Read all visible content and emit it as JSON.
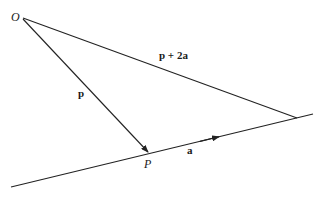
{
  "diagram": {
    "type": "vector-geometry",
    "points": {
      "O": {
        "label": "O",
        "x": 21,
        "y": 17
      },
      "P": {
        "label": "P",
        "x": 149,
        "y": 153
      },
      "Q": {
        "x": 297,
        "y": 118
      }
    },
    "line": {
      "x1": 11,
      "y1": 187,
      "x2": 313,
      "y2": 114
    },
    "vectors": [
      {
        "from": "O",
        "to": "P",
        "label": "p"
      },
      {
        "from": "O",
        "to": "Q",
        "label": "p + 2a"
      },
      {
        "along": "line",
        "label": "a",
        "arrow_at": {
          "x": 218,
          "y": 137
        }
      }
    ],
    "labels": {
      "O": "O",
      "P": "P",
      "p": "p",
      "a": "a",
      "p2a": "p + 2a"
    },
    "colors": {
      "stroke": "#222222",
      "background": "#ffffff"
    }
  }
}
